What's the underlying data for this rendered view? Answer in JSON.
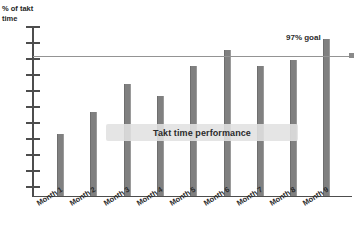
{
  "chart_data": {
    "type": "bar",
    "title": "",
    "subtitle": "",
    "xlabel": "",
    "ylabel": "% of takt time",
    "ylabel_lines": [
      "% of takt",
      "time"
    ],
    "categories": [
      "Month 1",
      "Month 2",
      "Month 3",
      "Month 4",
      "Month 5",
      "Month 6",
      "Month 7",
      "Month 8",
      "Month 9"
    ],
    "values": [
      38,
      52,
      69,
      62,
      80,
      90,
      80,
      84,
      97
    ],
    "ylim": [
      0,
      105
    ],
    "grid": false,
    "legend": "none",
    "series": [
      {
        "name": "Takt time performance",
        "values": [
          38,
          52,
          69,
          62,
          80,
          90,
          80,
          84,
          97
        ]
      }
    ],
    "annotations": [
      {
        "name": "goal-line",
        "label": "97% goal",
        "value": 97,
        "orientation": "horizontal"
      },
      {
        "name": "series-banner",
        "label": "Takt time performance"
      }
    ],
    "y_tick_count": 11,
    "colors": {
      "bar": "#808080",
      "goal_line": "#949494",
      "axis": "#4d4d4d",
      "banner_background": "#e1e1e1",
      "text": "#2b2b2b",
      "background": "#ffffff"
    }
  },
  "axis": {
    "y_label_line1": "% of takt",
    "y_label_line2": "time"
  },
  "goal": {
    "label": "97% goal"
  },
  "banner": {
    "label": "Takt time performance"
  },
  "x_labels": [
    {
      "label": "Month 1"
    },
    {
      "label": "Month 2"
    },
    {
      "label": "Month 3"
    },
    {
      "label": "Month 4"
    },
    {
      "label": "Month 5"
    },
    {
      "label": "Month 6"
    },
    {
      "label": "Month 7"
    },
    {
      "label": "Month 8"
    },
    {
      "label": "Month 9"
    }
  ]
}
